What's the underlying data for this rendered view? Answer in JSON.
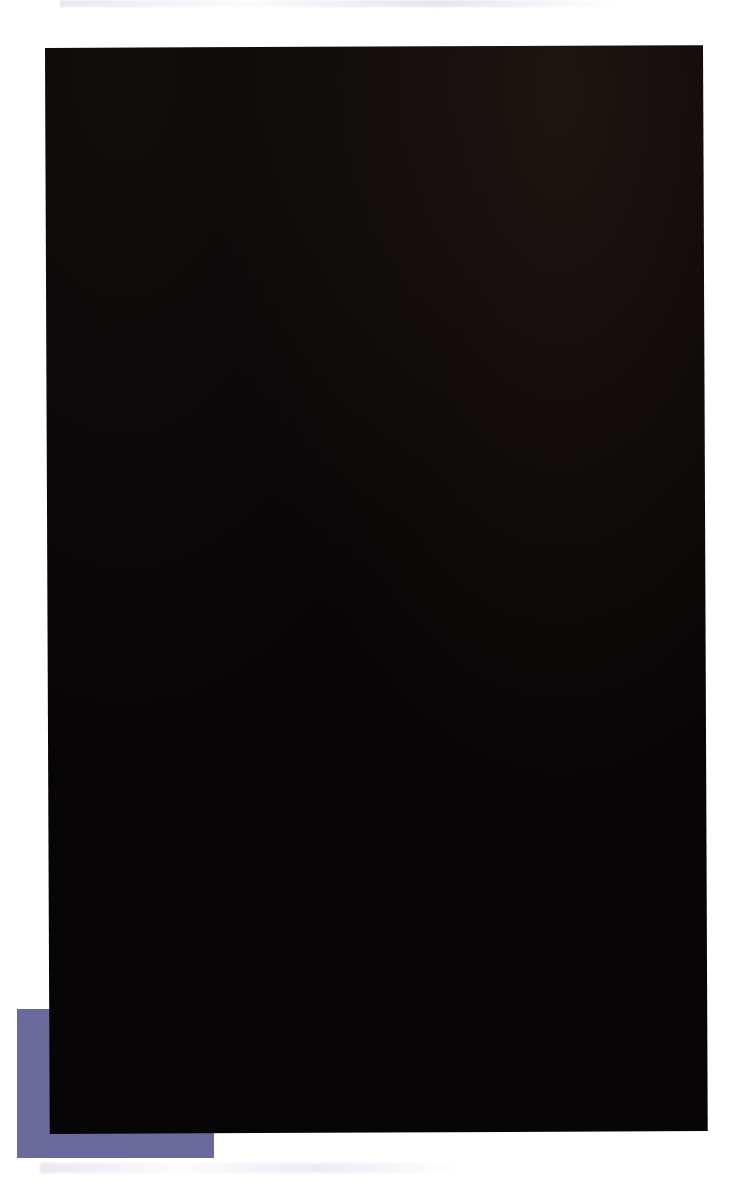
{
  "figure": {
    "background_color": "#ffffff",
    "plate_color": "#070506",
    "accent_block_color": "#6b6a9c",
    "axis_title": "Wavelength / nm",
    "axis_ticks": [
      "700",
      "600",
      "500",
      "400"
    ],
    "axis_tick_values": [
      700,
      600,
      500,
      400
    ]
  },
  "chart_data": {
    "type": "line",
    "xlabel": "Wavelength / nm",
    "ylabel": "",
    "xlim": [
      700,
      400
    ],
    "x_axis_direction": "decreasing",
    "tick_labels": [
      "700",
      "600",
      "500",
      "400"
    ],
    "grid": false,
    "legend": "none",
    "units": "nm",
    "panels": [
      {
        "name": "Hydrogen",
        "lines": [
          {
            "wavelength": 656.3,
            "label": "656.3",
            "color": "#d96a50",
            "width_px": 7,
            "name": "H-alpha"
          },
          {
            "wavelength": 486.1,
            "label": "486.1",
            "color": "#4a8fd0",
            "width_px": 6,
            "name": "H-beta"
          },
          {
            "wavelength": 434.0,
            "label": "434.0",
            "color": "#6a5c9e",
            "width_px": 2,
            "name": "H-gamma"
          },
          {
            "wavelength": 410.1,
            "label": "410.1",
            "color": "#6a5aa0",
            "width_px": 2,
            "name": "H-delta"
          }
        ]
      },
      {
        "name": "Helium",
        "lines": [
          {
            "wavelength": 667.8,
            "label": "667.8",
            "color": "#c96a4e",
            "width_px": 5
          },
          {
            "wavelength": 587.5,
            "label": "587.5",
            "color": "#e9e84c",
            "width_px": 5
          },
          {
            "wavelength": 501.5,
            "label": "501.5",
            "color": "#3ab8b0",
            "width_px": 6
          },
          {
            "wavelength": 492.1,
            "label": "492.1",
            "color": "#2e9ed4",
            "width_px": 5
          },
          {
            "wavelength": 471.3,
            "label": "471.3",
            "color": "#5a6ab8",
            "width_px": 4
          },
          {
            "wavelength": 447.1,
            "label": "447.1",
            "color": "#5558a8",
            "width_px": 3
          },
          {
            "wavelength": 402.6,
            "label": "402.6",
            "color": "#6a52a4",
            "width_px": 3
          }
        ]
      },
      {
        "name": "Mercury",
        "lines": [
          {
            "wavelength": 623.4,
            "label": "623.4",
            "color": "#d4833a",
            "width_px": 3
          },
          {
            "wavelength": 615.2,
            "label": "615.2",
            "color": "#d9a83c",
            "width_px": 3
          },
          {
            "wavelength": 579.0,
            "label": "579.0",
            "color": "#dede4a",
            "width_px": 4
          },
          {
            "wavelength": 577.0,
            "label": "577.0",
            "color": "#d8dc48",
            "width_px": 3
          },
          {
            "wavelength": 546.1,
            "label": "546.1",
            "color": "#a8d44a",
            "width_px": 7
          },
          {
            "wavelength": 502.5,
            "label": "502.5",
            "color": "#2fa8a4",
            "width_px": 2
          },
          {
            "wavelength": 435.8,
            "label": "435.8",
            "color": "#6a64b0",
            "width_px": 4
          },
          {
            "wavelength": 407.8,
            "label": "407.8",
            "color": "#5a4a9a",
            "width_px": 2
          },
          {
            "wavelength": 404.7,
            "label": "404.7",
            "color": "#5a4a9a",
            "width_px": 2
          }
        ]
      }
    ]
  }
}
